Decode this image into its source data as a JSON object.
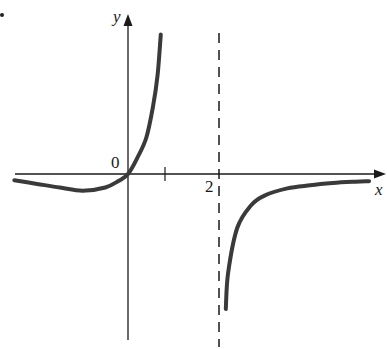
{
  "chart_data": {
    "type": "line",
    "title": "",
    "xlabel": "x",
    "ylabel": "y",
    "origin_label": "0",
    "tick_labels": [
      {
        "x": 2,
        "label": "2"
      }
    ],
    "ticks": [
      1,
      2
    ],
    "vertical_asymptote": {
      "x": 2,
      "style": "dashed"
    },
    "horizontal_asymptote": {
      "y": 0,
      "side": "both tails"
    },
    "xlim": [
      -2.5,
      5.7
    ],
    "ylim": [
      -3.7,
      3.5
    ],
    "grid": false,
    "legend": null,
    "series": [
      {
        "name": "left branch",
        "points": [
          [
            -2.5,
            -0.14
          ],
          [
            -2.0,
            -0.22
          ],
          [
            -1.5,
            -0.3
          ],
          [
            -1.0,
            -0.37
          ],
          [
            -0.5,
            -0.3
          ],
          [
            -0.2,
            -0.15
          ],
          [
            0,
            0
          ],
          [
            0.2,
            0.35
          ],
          [
            0.4,
            0.8
          ],
          [
            0.55,
            1.5
          ],
          [
            0.65,
            2.2
          ],
          [
            0.72,
            3.1
          ]
        ]
      },
      {
        "name": "right branch",
        "points": [
          [
            2.15,
            -3.0
          ],
          [
            2.2,
            -2.2
          ],
          [
            2.4,
            -1.2
          ],
          [
            2.7,
            -0.7
          ],
          [
            3.0,
            -0.48
          ],
          [
            3.5,
            -0.32
          ],
          [
            4.0,
            -0.25
          ],
          [
            4.5,
            -0.2
          ],
          [
            5.0,
            -0.17
          ],
          [
            5.3,
            -0.16
          ]
        ]
      }
    ],
    "colors": {
      "curve": "#3a3a3a",
      "axes": "#1a1a1a",
      "asymptote": "#1a1a1a"
    }
  },
  "labels": {
    "y_axis": "y",
    "x_axis": "x",
    "origin": "0",
    "tick_two": "2"
  }
}
